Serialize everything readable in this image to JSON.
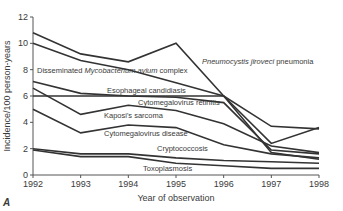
{
  "chart_data": {
    "type": "line",
    "title": "",
    "panel_label": "A",
    "xlabel": "Year of observation",
    "ylabel": "Incidence/100 person-years",
    "x": [
      1992,
      1993,
      1994,
      1995,
      1996,
      1997,
      1998
    ],
    "xticks": [
      "1992",
      "1993",
      "1994",
      "1995",
      "1996",
      "1997",
      "1998"
    ],
    "yticks": [
      "0",
      "2",
      "4",
      "6",
      "8",
      "10",
      "12"
    ],
    "ylim": [
      0,
      12
    ],
    "grid": false,
    "legend": "inline annotations",
    "series": [
      {
        "name": "Pneumocystis jiroveci pneumonia",
        "values": [
          10.8,
          9.2,
          8.6,
          10.0,
          6.0,
          2.4,
          3.6
        ]
      },
      {
        "name": "Disseminated Mycobacterium avium complex",
        "values": [
          10.0,
          8.7,
          8.0,
          7.0,
          6.0,
          3.7,
          3.5
        ]
      },
      {
        "name": "Esophageal candidiasis",
        "values": [
          6.0,
          6.0,
          6.0,
          6.0,
          6.0,
          1.7,
          1.2
        ]
      },
      {
        "name": "Cytomegalovirus retinitis",
        "values": [
          7.1,
          6.2,
          6.0,
          5.9,
          5.5,
          1.9,
          1.6
        ]
      },
      {
        "name": "Kaposi's sarcoma",
        "values": [
          6.6,
          4.6,
          5.3,
          4.9,
          3.9,
          2.2,
          1.7
        ]
      },
      {
        "name": "Cytomegalovirus disease",
        "values": [
          5.0,
          3.2,
          3.8,
          3.6,
          2.3,
          1.6,
          1.3
        ]
      },
      {
        "name": "Cryptococcosis",
        "values": [
          2.0,
          1.6,
          1.6,
          1.3,
          1.1,
          1.0,
          0.9
        ]
      },
      {
        "name": "Toxoplasmosis",
        "values": [
          1.9,
          1.4,
          1.4,
          0.9,
          0.7,
          0.5,
          0.5
        ]
      }
    ],
    "annotations": [
      {
        "parts": [
          {
            "text": "Disseminated ",
            "italic": false
          },
          {
            "text": "Mycobacterium avium",
            "italic": true
          },
          {
            "text": " complex",
            "italic": false
          }
        ],
        "x": 37,
        "y": 73
      },
      {
        "parts": [
          {
            "text": "Pneumocystis jiroveci",
            "italic": true
          },
          {
            "text": " pneumonia",
            "italic": false
          }
        ],
        "x": 202,
        "y": 64
      },
      {
        "parts": [
          {
            "text": "Esophageal candidiasis",
            "italic": false
          }
        ],
        "x": 107,
        "y": 93
      },
      {
        "parts": [
          {
            "text": "Cytomegalovirus retinitis",
            "italic": false
          }
        ],
        "x": 138,
        "y": 105
      },
      {
        "parts": [
          {
            "text": "Kaposi's sarcoma",
            "italic": false
          }
        ],
        "x": 104,
        "y": 118
      },
      {
        "parts": [
          {
            "text": "Cytomegalovirus disease",
            "italic": false
          }
        ],
        "x": 104,
        "y": 136
      },
      {
        "parts": [
          {
            "text": "Cryptococcosis",
            "italic": false
          }
        ],
        "x": 157,
        "y": 151
      },
      {
        "parts": [
          {
            "text": "Toxoplasmosis",
            "italic": false
          }
        ],
        "x": 143,
        "y": 171
      }
    ],
    "colors": {
      "line": "#333333",
      "axis": "#555555",
      "text": "#3a3a3a"
    }
  }
}
